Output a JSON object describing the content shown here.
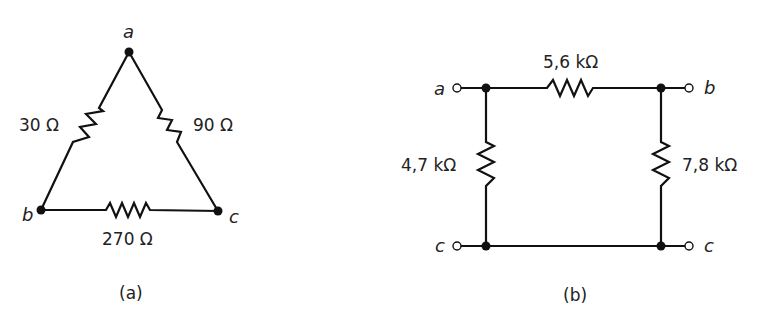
{
  "figure_a": {
    "caption": "(a)",
    "topology": "delta",
    "nodes": {
      "a": "a",
      "b": "b",
      "c": "c"
    },
    "resistors": [
      {
        "id": "R_ab",
        "between": [
          "a",
          "b"
        ],
        "label": "30 Ω"
      },
      {
        "id": "R_ac",
        "between": [
          "a",
          "c"
        ],
        "label": "90 Ω"
      },
      {
        "id": "R_bc",
        "between": [
          "b",
          "c"
        ],
        "label": "270 Ω"
      }
    ]
  },
  "figure_b": {
    "caption": "(b)",
    "topology": "pi",
    "terminals": {
      "top_left": "a",
      "top_right": "b",
      "bottom_left": "c",
      "bottom_right": "c"
    },
    "resistors": [
      {
        "id": "R_top",
        "between": [
          "a",
          "b"
        ],
        "label": "5,6 kΩ"
      },
      {
        "id": "R_left",
        "between": [
          "a",
          "c"
        ],
        "label": "4,7 kΩ"
      },
      {
        "id": "R_right",
        "between": [
          "b",
          "c"
        ],
        "label": "7,8 kΩ"
      }
    ]
  }
}
